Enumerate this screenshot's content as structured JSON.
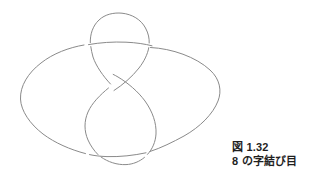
{
  "figure": {
    "name": "figure-eight-knot-diagram",
    "description_icon": "knot-diagram-icon",
    "stroke_color": "#8a8a8a",
    "background_color": "#ffffff",
    "stroke_width": 1,
    "components": [
      {
        "name": "outer-ellipse",
        "cx": 120,
        "cy": 97,
        "rx": 100,
        "ry": 57
      },
      {
        "name": "upper-small-loop",
        "top_y": 13,
        "left_x": 90,
        "right_x": 148
      },
      {
        "name": "lower-large-loop",
        "top_y": 85,
        "left_x": 85,
        "right_x": 155,
        "bottom_y": 163
      },
      {
        "name": "central-crossing",
        "x": 110,
        "y": 85
      }
    ]
  },
  "caption": {
    "line1": "図 1.32",
    "line2": "8 の字結び目",
    "color": "#1f1f1f"
  }
}
